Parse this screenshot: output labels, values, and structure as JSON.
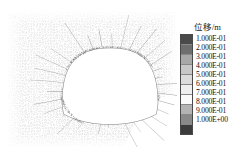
{
  "figure": {
    "background_color": "#ffffff",
    "plot": {
      "name": "tunnel-displacement-mesh",
      "description": "Numerical mesh contour plot of displacement around a horseshoe-shaped tunnel opening",
      "mesh_dot_color": "#9a9a9a",
      "contour_line_color": "#6e6e6e",
      "opening_fill": "#ffffff"
    }
  },
  "legend": {
    "title": "位移/m",
    "entries": [
      {
        "label": "1.000E-01",
        "color": "#4a4a4a"
      },
      {
        "label": "2.000E-01",
        "color": "#6e6e6e"
      },
      {
        "label": "3.000E-01",
        "color": "#a8a8a8"
      },
      {
        "label": "4.000E-01",
        "color": "#c8c8c8"
      },
      {
        "label": "5.000E-01",
        "color": "#dcdcdc"
      },
      {
        "label": "6.000E-01",
        "color": "#efefef"
      },
      {
        "label": "7.000E-01",
        "color": "#fafafa"
      },
      {
        "label": "8.000E-01",
        "color": "#b4b4b4"
      },
      {
        "label": "9.000E-01",
        "color": "#8a8a8a"
      },
      {
        "label": "1.000E+00",
        "color": "#3c3c3c"
      }
    ]
  },
  "chart_data": {
    "type": "heatmap",
    "title": "位移/m",
    "xlabel": "",
    "ylabel": "",
    "colorbar_label": "位移/m",
    "colorbar_ticks": [
      "1.000E-01",
      "2.000E-01",
      "3.000E-01",
      "4.000E-01",
      "5.000E-01",
      "6.000E-01",
      "7.000E-01",
      "8.000E-01",
      "9.000E-01",
      "1.000E+00"
    ],
    "colorbar_values": [
      0.1,
      0.2,
      0.3,
      0.4,
      0.5,
      0.6,
      0.7,
      0.8,
      0.9,
      1.0
    ],
    "colorbar_unit": "m",
    "colorbar_position": "right",
    "grid": false,
    "legend_position": "right",
    "annotations": [],
    "geometry": {
      "feature": "tunnel-opening",
      "shape": "horseshoe",
      "center_x": 110,
      "center_y": 88,
      "half_width": 48,
      "crown_top_y": 48,
      "invert_bottom_y": 128
    }
  }
}
